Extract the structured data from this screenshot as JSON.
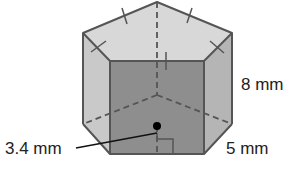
{
  "figure": {
    "type": "pentagonal-prism",
    "labels": {
      "height": "8 mm",
      "base_edge": "5 mm",
      "apothem": "3.4 mm"
    },
    "colors": {
      "front_face": "#8e8e8e",
      "top_face": "#d8d8d8",
      "left_face": "#c9c9c9",
      "right_face": "#b5b5b5",
      "edge": "#555555",
      "hidden_edge": "#555555",
      "leader": "#111111",
      "dot": "#000000"
    }
  }
}
